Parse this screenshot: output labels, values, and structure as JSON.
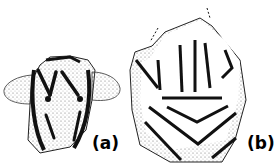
{
  "figure": {
    "panels": [
      {
        "id": "a",
        "label": "(a)",
        "description": "Line drawing of a figurine fragment with two lateral lobes, incised V-shaped grooves and two punctate dots"
      },
      {
        "id": "b",
        "label": "(b)",
        "description": "Line drawing of a polygonal fragment with vertical incised lines above a horizontal line and nested chevron grooves below"
      }
    ],
    "colors": {
      "ink": "#000000",
      "background": "#ffffff",
      "stipple": "#555555"
    }
  }
}
